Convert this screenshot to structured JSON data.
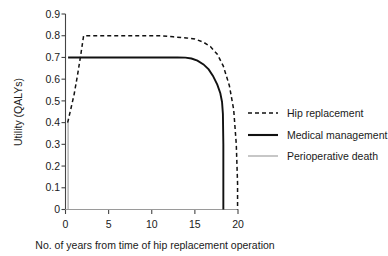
{
  "chart_data": {
    "type": "line",
    "title": "",
    "xlabel": "No. of years from time of hip replacement operation",
    "ylabel": "Utility (QALYs)",
    "xlim": [
      0,
      20
    ],
    "ylim": [
      0,
      0.9
    ],
    "grid": false,
    "legend_position": "right",
    "xticks": [
      "0",
      "5",
      "10",
      "15",
      "20"
    ],
    "xtick_values": [
      0,
      5,
      10,
      15,
      20
    ],
    "yticks": [
      "0",
      "0.1",
      "0.2",
      "0.3",
      "0.4",
      "0.5",
      "0.6",
      "0.7",
      "0.8",
      "0.9"
    ],
    "ytick_values": [
      0,
      0.1,
      0.2,
      0.3,
      0.4,
      0.5,
      0.6,
      0.7,
      0.8,
      0.9
    ],
    "series": [
      {
        "name": "Hip replacement",
        "style": "dashed",
        "color": "#111111",
        "x": [
          0.25,
          0.6,
          1.0,
          1.4,
          1.8,
          2.1,
          3,
          5,
          7,
          9,
          11,
          12.5,
          14,
          15,
          16,
          16.8,
          17.6,
          18.3,
          19.0,
          19.5,
          19.8,
          19.95,
          19.95
        ],
        "y": [
          0.4,
          0.46,
          0.53,
          0.62,
          0.72,
          0.8,
          0.8,
          0.8,
          0.8,
          0.8,
          0.8,
          0.795,
          0.79,
          0.785,
          0.77,
          0.75,
          0.715,
          0.66,
          0.57,
          0.46,
          0.3,
          0.12,
          0.0
        ]
      },
      {
        "name": "Medical management",
        "style": "solid",
        "color": "#111111",
        "x": [
          0.3,
          2,
          5,
          8,
          11,
          13,
          13.9,
          14.6,
          15.3,
          16.0,
          16.6,
          17.1,
          17.6,
          17.95,
          18.15,
          18.25,
          18.3,
          18.3
        ],
        "y": [
          0.7,
          0.7,
          0.7,
          0.7,
          0.7,
          0.7,
          0.699,
          0.695,
          0.685,
          0.668,
          0.645,
          0.615,
          0.575,
          0.535,
          0.495,
          0.44,
          0.3,
          0.0
        ]
      },
      {
        "name": "Perioperative death",
        "style": "thin-solid",
        "color": "#9a9a9a",
        "x": [
          0.3,
          0.3
        ],
        "y": [
          0.4,
          0.0
        ]
      }
    ]
  },
  "legend": {
    "items": [
      {
        "label": "Hip replacement"
      },
      {
        "label": "Medical management"
      },
      {
        "label": "Perioperative death"
      }
    ]
  },
  "colors": {
    "hip_replacement": "#111111",
    "medical_management": "#111111",
    "perioperative_death": "#9a9a9a",
    "axis": "#444444",
    "background": "#ffffff"
  }
}
